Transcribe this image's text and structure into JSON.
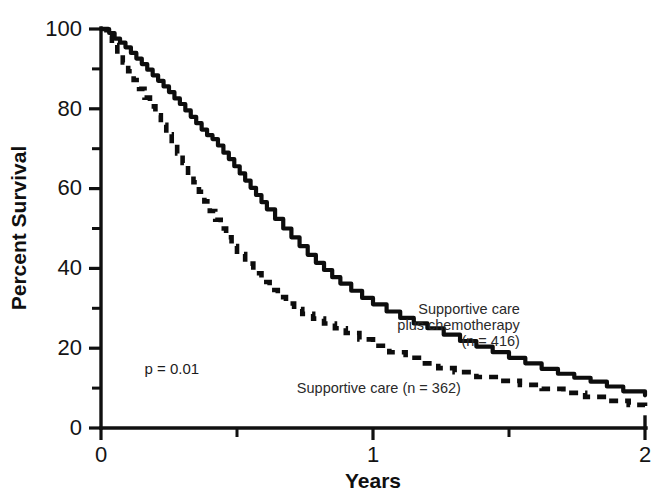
{
  "chart_data": {
    "type": "line",
    "title": "",
    "xlabel": "Years",
    "ylabel": "Percent Survival",
    "xlim": [
      0,
      2
    ],
    "ylim": [
      0,
      100
    ],
    "grid": false,
    "legend_position": "inline-annotations",
    "x_ticks_major": [
      "0",
      "1",
      "2"
    ],
    "x_ticks_major_values": [
      0,
      1,
      2
    ],
    "x_ticks_minor_values": [
      0.5,
      1.5
    ],
    "y_ticks_major": [
      "0",
      "20",
      "40",
      "60",
      "80",
      "100"
    ],
    "y_ticks_major_values": [
      0,
      20,
      40,
      60,
      80,
      100
    ],
    "y_ticks_minor_values": [
      10,
      30,
      50,
      70,
      90
    ],
    "annotations": [
      {
        "name": "p-value",
        "text": "p = 0.01",
        "x": 0.16,
        "y": 13.5
      },
      {
        "name": "supportive-care-label",
        "text": "Supportive care (n = 362)",
        "x": 0.72,
        "y": 8.8
      },
      {
        "name": "chemo-label-line1",
        "text": "Supportive care",
        "x": 1.54,
        "y": 28.5
      },
      {
        "name": "chemo-label-line2",
        "text": "plus chemotherapy",
        "x": 1.54,
        "y": 24.5
      },
      {
        "name": "chemo-label-line3",
        "text": "(n = 416)",
        "x": 1.54,
        "y": 20.6
      }
    ],
    "series": [
      {
        "name": "Supportive care plus chemotherapy",
        "style": "solid",
        "n": 416,
        "label": "Supportive care plus chemotherapy (n = 416)",
        "x": [
          0.0,
          0.03,
          0.05,
          0.07,
          0.09,
          0.11,
          0.13,
          0.15,
          0.17,
          0.19,
          0.21,
          0.23,
          0.25,
          0.27,
          0.29,
          0.31,
          0.33,
          0.35,
          0.37,
          0.39,
          0.41,
          0.43,
          0.45,
          0.47,
          0.49,
          0.51,
          0.53,
          0.55,
          0.57,
          0.59,
          0.61,
          0.64,
          0.67,
          0.7,
          0.73,
          0.76,
          0.79,
          0.82,
          0.85,
          0.88,
          0.92,
          0.96,
          1.0,
          1.05,
          1.1,
          1.15,
          1.2,
          1.26,
          1.32,
          1.38,
          1.44,
          1.5,
          1.56,
          1.62,
          1.68,
          1.74,
          1.8,
          1.86,
          1.92,
          2.0
        ],
        "y": [
          100.0,
          99.0,
          97.6,
          96.6,
          95.4,
          94.0,
          92.6,
          91.2,
          89.8,
          88.4,
          87.0,
          85.6,
          84.2,
          82.6,
          81.2,
          79.6,
          78.0,
          76.4,
          74.8,
          73.4,
          72.4,
          70.8,
          69.0,
          67.4,
          65.6,
          63.8,
          62.0,
          60.2,
          58.4,
          56.6,
          54.8,
          52.4,
          50.0,
          47.8,
          45.6,
          43.4,
          41.4,
          39.6,
          37.8,
          36.2,
          34.4,
          32.6,
          31.0,
          29.2,
          27.6,
          26.2,
          25.0,
          23.4,
          21.8,
          20.4,
          19.0,
          17.6,
          16.2,
          14.8,
          13.6,
          12.6,
          11.6,
          10.4,
          9.2,
          8.2
        ]
      },
      {
        "name": "Supportive care",
        "style": "dashed",
        "n": 362,
        "label": "Supportive care (n = 362)",
        "x": [
          0.0,
          0.02,
          0.04,
          0.06,
          0.08,
          0.1,
          0.12,
          0.14,
          0.16,
          0.18,
          0.2,
          0.22,
          0.24,
          0.26,
          0.28,
          0.3,
          0.32,
          0.34,
          0.36,
          0.38,
          0.4,
          0.42,
          0.44,
          0.46,
          0.48,
          0.5,
          0.53,
          0.56,
          0.59,
          0.62,
          0.65,
          0.68,
          0.71,
          0.74,
          0.78,
          0.82,
          0.86,
          0.9,
          0.95,
          1.0,
          1.06,
          1.12,
          1.18,
          1.24,
          1.3,
          1.38,
          1.46,
          1.54,
          1.62,
          1.7,
          1.78,
          1.86,
          1.94,
          2.0
        ],
        "y": [
          100.0,
          98.2,
          96.0,
          93.8,
          91.6,
          89.4,
          87.2,
          85.0,
          82.8,
          80.6,
          78.4,
          76.0,
          73.6,
          71.2,
          68.8,
          66.4,
          64.0,
          61.6,
          59.2,
          56.8,
          54.4,
          52.2,
          50.0,
          47.8,
          45.6,
          43.6,
          41.2,
          38.8,
          36.6,
          34.6,
          32.8,
          31.2,
          29.8,
          28.6,
          27.4,
          26.2,
          25.0,
          23.8,
          22.2,
          20.6,
          19.0,
          17.6,
          16.2,
          15.0,
          14.0,
          12.8,
          11.8,
          10.8,
          9.8,
          8.8,
          7.8,
          6.8,
          5.8,
          5.0
        ]
      }
    ]
  }
}
